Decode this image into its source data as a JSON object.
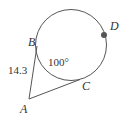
{
  "diagram": {
    "points": {
      "A": {
        "label": "A"
      },
      "B": {
        "label": "B"
      },
      "C": {
        "label": "C"
      },
      "D": {
        "label": "D"
      }
    },
    "segment_AB_length": "14.3",
    "arc_BC_measure": "100°",
    "colors": {
      "stroke": "#555555",
      "dot": "#555555"
    }
  }
}
